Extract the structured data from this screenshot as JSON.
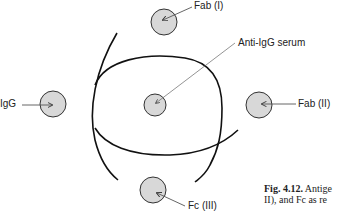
{
  "diagram": {
    "type": "immunodiffusion",
    "wells": [
      {
        "id": "fab1",
        "label": "Fab (I)",
        "cx": 164,
        "cy": 22,
        "r": 13
      },
      {
        "id": "igg",
        "label": "IgG",
        "cx": 53,
        "cy": 104,
        "r": 13
      },
      {
        "id": "anti_igg",
        "label": "Anti-IgG serum",
        "cx": 155,
        "cy": 105,
        "r": 11
      },
      {
        "id": "fab2",
        "label": "Fab (II)",
        "cx": 259,
        "cy": 105,
        "r": 13
      },
      {
        "id": "fc3",
        "label": "Fc (III)",
        "cx": 153,
        "cy": 190,
        "r": 13
      }
    ],
    "colors": {
      "well_fill": "#d8d8d8",
      "well_stroke": "#333333",
      "precipitin_line": "#111111",
      "pointer_line": "#555555"
    }
  },
  "labels": {
    "fab1": "Fab (I)",
    "igg": "IgG",
    "anti_igg": "Anti-IgG serum",
    "fab2": "Fab (II)",
    "fc3": "Fc (III)"
  },
  "caption": {
    "fig_number": "Fig. 4.12.",
    "line1_rest": " Antige",
    "line2": "II), and Fc as re"
  }
}
